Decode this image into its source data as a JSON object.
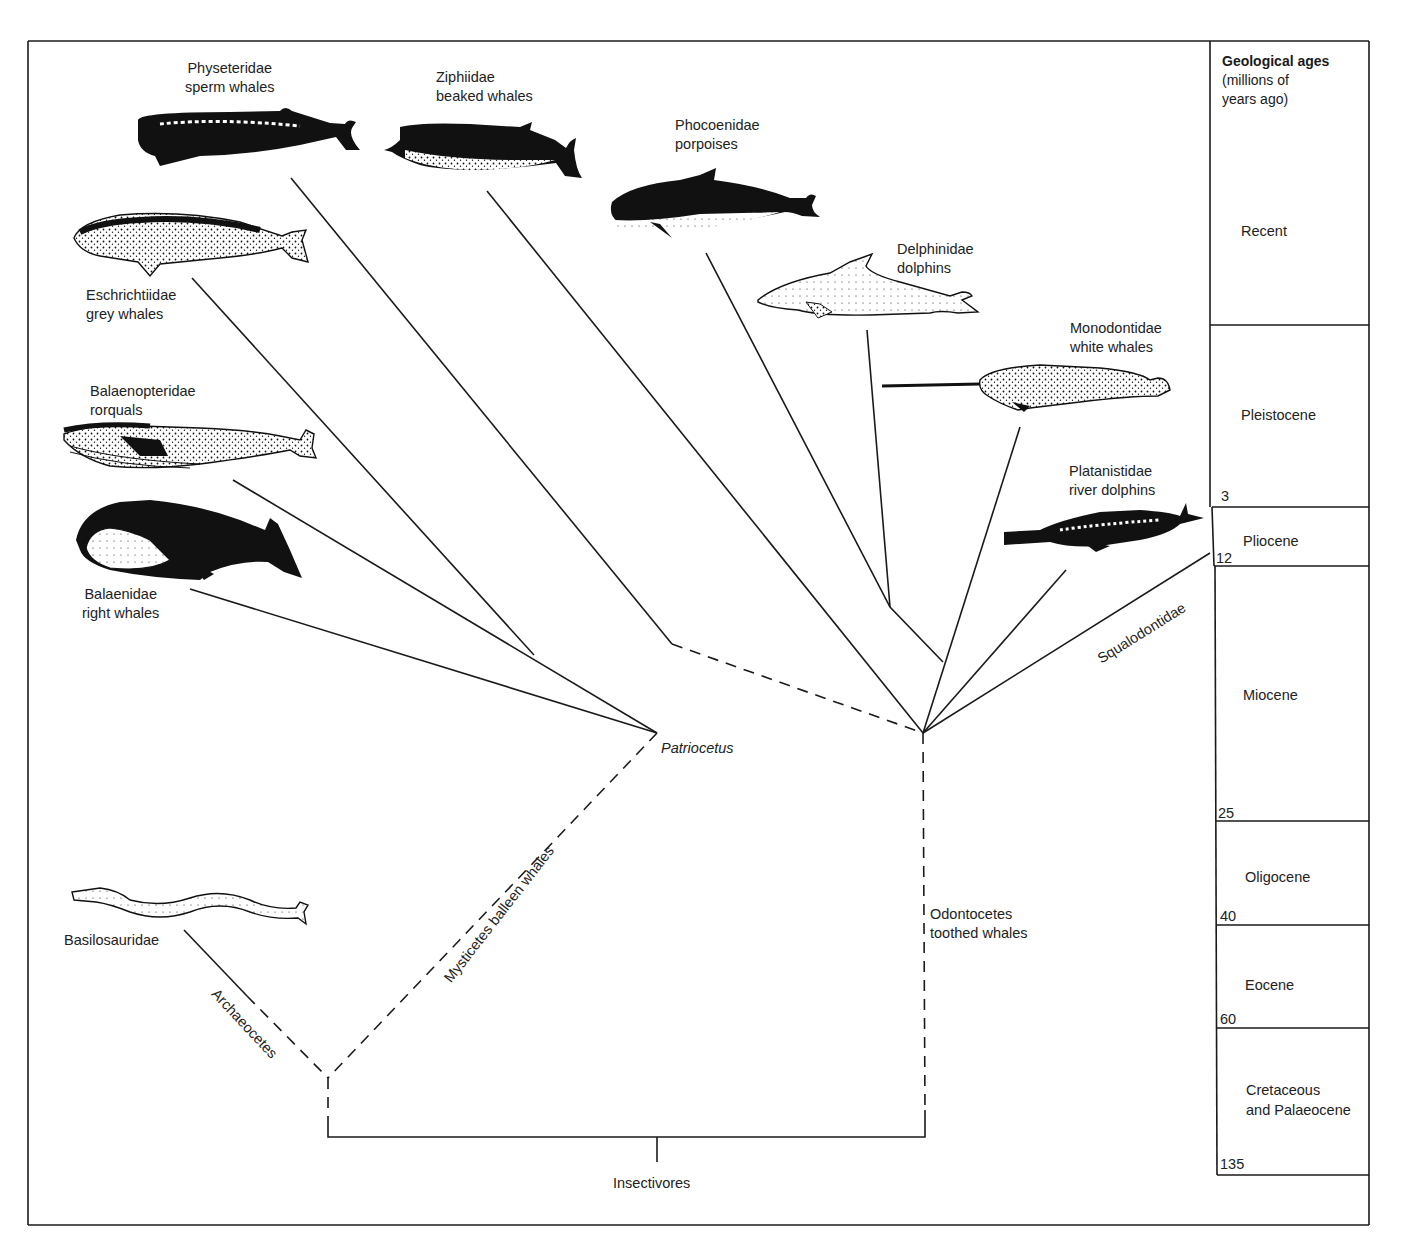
{
  "figure": {
    "colors": {
      "ink": "#1a1a1a",
      "background": "#ffffff"
    }
  },
  "families": [
    {
      "id": "physeteridae",
      "name": "Physeteridae",
      "common": "sperm whales",
      "icon": "sperm-whale-illustration"
    },
    {
      "id": "ziphiidae",
      "name": "Ziphiidae",
      "common": "beaked whales",
      "icon": "beaked-whale-illustration"
    },
    {
      "id": "phocoenidae",
      "name": "Phocoenidae",
      "common": "porpoises",
      "icon": "porpoise-illustration"
    },
    {
      "id": "delphinidae",
      "name": "Delphinidae",
      "common": "dolphins",
      "icon": "dolphin-illustration"
    },
    {
      "id": "monodontidae",
      "name": "Monodontidae",
      "common": "white whales",
      "icon": "narwhal-illustration"
    },
    {
      "id": "platanistidae",
      "name": "Platanistidae",
      "common": "river dolphins",
      "icon": "river-dolphin-illustration"
    },
    {
      "id": "eschrichtiidae",
      "name": "Eschrichtiidae",
      "common": "grey whales",
      "icon": "grey-whale-illustration"
    },
    {
      "id": "balaenopteridae",
      "name": "Balaenopteridae",
      "common": "rorquals",
      "icon": "rorqual-illustration"
    },
    {
      "id": "balaenidae",
      "name": "Balaenidae",
      "common": "right whales",
      "icon": "right-whale-illustration"
    },
    {
      "id": "basilosauridae",
      "name": "Basilosauridae",
      "common": "",
      "icon": "basilosaurus-illustration"
    }
  ],
  "groups": {
    "mysticetes": {
      "name": "Mysticetes",
      "common": "balleen whales"
    },
    "odontocetes": {
      "name": "Odontocetes",
      "common": "toothed whales"
    },
    "archaeocetes": {
      "name": "Archaeocetes"
    },
    "squalodontidae": {
      "name": "Squalodontidae"
    },
    "patriocetus": {
      "name": "Patriocetus"
    },
    "root": {
      "name": "Insectivores"
    }
  },
  "geology": {
    "title": "Geological ages",
    "subtitle_line1": "(millions of",
    "subtitle_line2": "years ago)",
    "periods": [
      {
        "name": "Recent",
        "line2": "",
        "mya": ""
      },
      {
        "name": "Pleistocene",
        "line2": "",
        "mya": "3"
      },
      {
        "name": "Pliocene",
        "line2": "",
        "mya": "12"
      },
      {
        "name": "Miocene",
        "line2": "",
        "mya": "25"
      },
      {
        "name": "Oligocene",
        "line2": "",
        "mya": "40"
      },
      {
        "name": "Eocene",
        "line2": "",
        "mya": "60"
      },
      {
        "name": "Cretaceous",
        "line2": "and Palaeocene",
        "mya": "135"
      }
    ]
  }
}
